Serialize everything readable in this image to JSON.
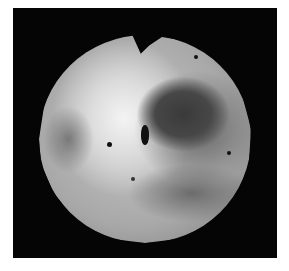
{
  "image": {
    "description": "Grayscale astronomical image of a rocky spherical moon on a black background",
    "subject": "moon-sphere",
    "background_color": "#050505",
    "frame_color": "#ffffff",
    "features": [
      {
        "name": "dark-region",
        "location": "upper-right"
      },
      {
        "name": "bright-region",
        "location": "upper-left-center"
      },
      {
        "name": "dark-spot",
        "location": "center"
      }
    ]
  }
}
